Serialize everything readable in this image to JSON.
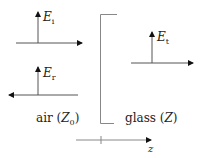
{
  "diagram": {
    "incident": {
      "symbol": "E",
      "subscript": "i"
    },
    "reflected": {
      "symbol": "E",
      "subscript": "r"
    },
    "transmitted": {
      "symbol": "E",
      "subscript": "t"
    },
    "media": {
      "left": {
        "name": "air",
        "impedance_symbol": "Z",
        "impedance_subscript": "0"
      },
      "right": {
        "name": "glass",
        "impedance_symbol": "Z"
      }
    },
    "axis": {
      "label": "z"
    },
    "colors": {
      "line": "#555555",
      "text": "#222222"
    }
  }
}
